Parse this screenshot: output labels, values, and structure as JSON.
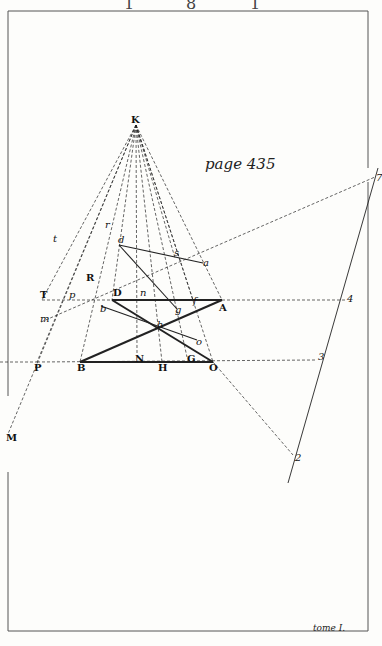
{
  "header": {
    "marks": [
      "1",
      "8",
      "1"
    ]
  },
  "caption_page": "page 435",
  "caption_tome": "tome I.",
  "colors": {
    "ink": "#222222",
    "paper": "#fdfdfb",
    "frame": "#555555"
  },
  "frame": {
    "left": 8,
    "top": 11,
    "right": 368,
    "bottom": 631,
    "gaps": [
      {
        "side": "left",
        "y1": 396,
        "y2": 472
      },
      {
        "side": "right",
        "y1": 57,
        "y2": 88
      }
    ]
  },
  "points": {
    "K": [
      136,
      125
    ],
    "d": [
      119,
      245
    ],
    "s": [
      175,
      258
    ],
    "a": [
      203,
      263
    ],
    "T": [
      42,
      300
    ],
    "p": [
      70,
      300
    ],
    "D": [
      112,
      300
    ],
    "n": [
      145,
      299
    ],
    "f": [
      193,
      300
    ],
    "A": [
      222,
      300
    ],
    "4": [
      345,
      300
    ],
    "m": [
      41,
      322
    ],
    "b": [
      101,
      306
    ],
    "g": [
      177,
      309
    ],
    "h": [
      160,
      332
    ],
    "o": [
      197,
      340
    ],
    "N": [
      137,
      353
    ],
    "G": [
      187,
      357
    ],
    "P": [
      37,
      362
    ],
    "B": [
      80,
      362
    ],
    "H": [
      162,
      362
    ],
    "O": [
      213,
      362
    ],
    "3": [
      315,
      360
    ],
    "2": [
      293,
      455
    ],
    "7": [
      375,
      177
    ],
    "M": [
      8,
      434
    ],
    "t": [
      57,
      245
    ],
    "r": [
      108,
      226
    ],
    "R": [
      88,
      272
    ]
  },
  "labels": [
    {
      "t": "K",
      "x": 131,
      "y": 123,
      "style": "b"
    },
    {
      "t": "d",
      "x": 118,
      "y": 243,
      "style": "i"
    },
    {
      "t": "s",
      "x": 174,
      "y": 256,
      "style": "i"
    },
    {
      "t": "a",
      "x": 203,
      "y": 266,
      "style": "i"
    },
    {
      "t": "t",
      "x": 53,
      "y": 242,
      "style": "i"
    },
    {
      "t": "r",
      "x": 105,
      "y": 228,
      "style": "i"
    },
    {
      "t": "R",
      "x": 86,
      "y": 281,
      "style": "b"
    },
    {
      "t": "T",
      "x": 40,
      "y": 298,
      "style": "b"
    },
    {
      "t": "p",
      "x": 69,
      "y": 298,
      "style": "i"
    },
    {
      "t": "D",
      "x": 113,
      "y": 296,
      "style": "b"
    },
    {
      "t": "n",
      "x": 140,
      "y": 296,
      "style": "i"
    },
    {
      "t": "f",
      "x": 193,
      "y": 304,
      "style": "i"
    },
    {
      "t": "A",
      "x": 219,
      "y": 311,
      "style": "b"
    },
    {
      "t": "4",
      "x": 347,
      "y": 302,
      "style": "i"
    },
    {
      "t": "m",
      "x": 40,
      "y": 322,
      "style": "i"
    },
    {
      "t": "b",
      "x": 100,
      "y": 312,
      "style": "i"
    },
    {
      "t": "g",
      "x": 175,
      "y": 313,
      "style": "i"
    },
    {
      "t": "h",
      "x": 157,
      "y": 328,
      "style": "i"
    },
    {
      "t": "o",
      "x": 196,
      "y": 345,
      "style": "i"
    },
    {
      "t": "N",
      "x": 135,
      "y": 362,
      "style": "b"
    },
    {
      "t": "G",
      "x": 187,
      "y": 362,
      "style": "b"
    },
    {
      "t": "P",
      "x": 34,
      "y": 371,
      "style": "b"
    },
    {
      "t": "B",
      "x": 77,
      "y": 371,
      "style": "b"
    },
    {
      "t": "H",
      "x": 158,
      "y": 371,
      "style": "b"
    },
    {
      "t": "O",
      "x": 209,
      "y": 371,
      "style": "b"
    },
    {
      "t": "3",
      "x": 318,
      "y": 360,
      "style": "i"
    },
    {
      "t": "2",
      "x": 295,
      "y": 461,
      "style": "i"
    },
    {
      "t": "7",
      "x": 376,
      "y": 181,
      "style": "i"
    },
    {
      "t": "M",
      "x": 6,
      "y": 441,
      "style": "b"
    }
  ],
  "solid_lines": [
    [
      "D",
      "A"
    ],
    [
      "B",
      "O"
    ],
    [
      "B",
      "A"
    ],
    [
      "D",
      "O"
    ],
    [
      "d",
      "a"
    ],
    [
      "d",
      "g"
    ],
    [
      "b",
      "o"
    ]
  ],
  "thin_solid_lines": [
    {
      "from": [
        288,
        483
      ],
      "to": [
        378,
        168
      ]
    }
  ],
  "dashed_lines": [
    [
      "K",
      "T"
    ],
    [
      "K",
      "M"
    ],
    [
      "K",
      "P"
    ],
    [
      "K",
      "B"
    ],
    [
      "K",
      "D"
    ],
    [
      "K",
      "N"
    ],
    [
      "K",
      "H"
    ],
    [
      "K",
      "G"
    ],
    [
      "K",
      "O"
    ],
    [
      "K",
      "A"
    ],
    [
      "K",
      "f"
    ],
    [
      "T",
      "4"
    ],
    [
      "P",
      "3"
    ],
    [
      "m",
      "7"
    ],
    [
      "O",
      "2"
    ],
    [
      "K",
      "s"
    ]
  ]
}
